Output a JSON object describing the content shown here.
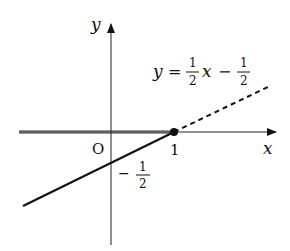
{
  "diagram": {
    "type": "coordinate-graph",
    "axes": {
      "x_label": "x",
      "y_label": "y",
      "origin_label": "O"
    },
    "tick_labels": {
      "x_one": "1",
      "y_neg_half_sign": "−",
      "y_neg_half_num": "1",
      "y_neg_half_den": "2"
    },
    "equation": {
      "lhs": "y",
      "eq": "=",
      "frac1_num": "1",
      "frac1_den": "2",
      "var": "x",
      "minus": "−",
      "frac2_num": "1",
      "frac2_den": "2"
    },
    "colors": {
      "line": "#111111",
      "highlight": "#9a9a9a",
      "axis": "#222222"
    }
  }
}
